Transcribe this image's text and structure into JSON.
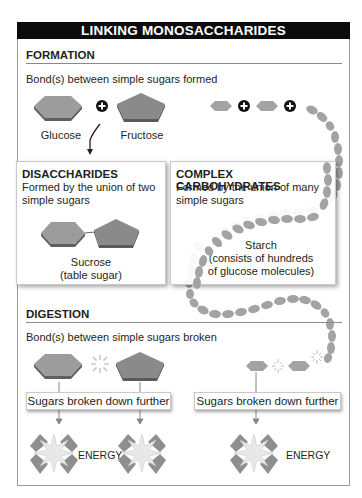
{
  "title": "LINKING MONOSACCHARIDES",
  "colors": {
    "banner_bg": "#0c0c0c",
    "banner_text": "#ffffff",
    "sugar_light": "#9a9a9a",
    "sugar_dark": "#858585",
    "sugar_edge": "#5f5f5f",
    "starch_bead": "#a3a3a3",
    "plus_badge": "#111111",
    "energy_burst": "#e8e8e8"
  },
  "formation": {
    "heading": "FORMATION",
    "subtitle": "Bond(s) between simple sugars formed",
    "molecules": [
      {
        "name": "Glucose",
        "shape": "hexagon-icon"
      },
      {
        "name": "Fructose",
        "shape": "pentagon-icon"
      }
    ],
    "plus_symbol": "+",
    "chain_icons": [
      "hexagon-icon",
      "plus-icon",
      "hexagon-icon",
      "plus-icon",
      "starch-chain-icon"
    ]
  },
  "disaccharides": {
    "heading": "DISACCHARIDES",
    "description_line1": "Formed by the union of two",
    "description_line2": "simple sugars",
    "example_line1": "Sucrose",
    "example_line2": "(table sugar)"
  },
  "complex_carbohydrates": {
    "heading": "COMPLEX CARBOHYDRATES",
    "description_line1": "Formed by the union of many",
    "description_line2": "simple sugars",
    "example_line1": "Starch",
    "example_line2": "(consists of hundreds",
    "example_line3": "of glucose molecules)"
  },
  "digestion": {
    "heading": "DIGESTION",
    "subtitle": "Bond(s) between simple sugars broken",
    "breakdown_left": "Sugars broken down further",
    "breakdown_right": "Sugars broken down further",
    "energy_left": "ENERGY",
    "energy_right": "ENERGY"
  }
}
